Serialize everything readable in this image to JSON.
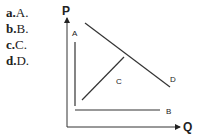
{
  "options": [
    {
      "letter": "a.",
      "text": "A."
    },
    {
      "letter": "b.",
      "text": "B."
    },
    {
      "letter": "c.",
      "text": "C."
    },
    {
      "letter": "d.",
      "text": "D."
    }
  ],
  "diagram": {
    "y_axis_label": "P",
    "x_axis_label": "Q",
    "curves": [
      {
        "id": "A",
        "label": "A",
        "shape": "vertical"
      },
      {
        "id": "B",
        "label": "B",
        "shape": "horizontal"
      },
      {
        "id": "C",
        "label": "C",
        "shape": "upward-sloping"
      },
      {
        "id": "D",
        "label": "D",
        "shape": "downward-sloping"
      }
    ]
  }
}
